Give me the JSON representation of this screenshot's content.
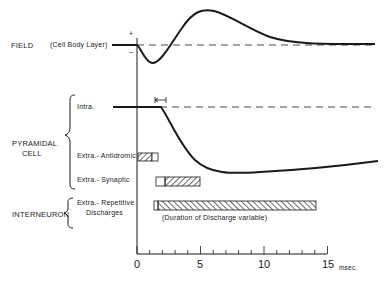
{
  "labels": {
    "field": "FIELD",
    "field_sub": "(Cell Body Layer)",
    "plus": "+",
    "minus": "–",
    "pyramidal_line1": "PYRAMIDAL",
    "pyramidal_line2": "CELL",
    "intra": "Intra.",
    "extra_antidromic": "Extra.- Antidromic",
    "extra_synaptic": "Extra.- Synaptic",
    "interneuron": "INTERNEURON",
    "repetitive_line1": "Extra.- Repetitive",
    "repetitive_line2": "Discharges",
    "duration_note": "(Duration of Discharge variable)"
  },
  "axis": {
    "ticks": [
      "0",
      "5",
      "10",
      "15"
    ],
    "unit": "msec."
  },
  "colors": {
    "ink": "#1a1a1a",
    "background": "#ffffff"
  }
}
